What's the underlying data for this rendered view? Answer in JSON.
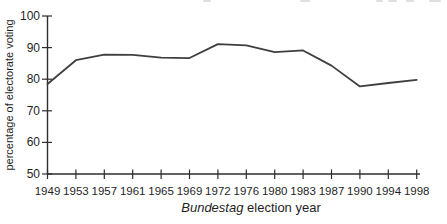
{
  "chart_data": {
    "type": "line",
    "title": "",
    "categories": [
      "1949",
      "1953",
      "1957",
      "1961",
      "1965",
      "1969",
      "1972",
      "1976",
      "1980",
      "1983",
      "1987",
      "1990",
      "1994",
      "1998"
    ],
    "values": [
      78.5,
      86.0,
      87.8,
      87.7,
      86.8,
      86.7,
      91.1,
      90.7,
      88.6,
      89.1,
      84.3,
      77.7,
      78.8,
      79.8
    ],
    "xlabel": "Bundestag election year",
    "xlabel_italic": "Bundestag",
    "xlabel_rest": " election year",
    "ylabel": "percentage of electorate voting",
    "ylim": [
      50,
      100
    ],
    "yticks": [
      50,
      60,
      70,
      80,
      90,
      100
    ],
    "grid": false,
    "legend": null
  },
  "colors": {
    "line": "#3f3f3f",
    "axis": "#2e2e2e",
    "text": "#1f1f1f",
    "background": "#ffffff"
  }
}
